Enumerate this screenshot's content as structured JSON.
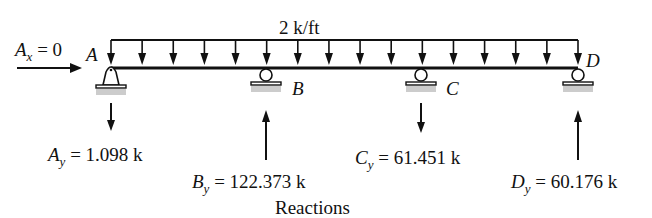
{
  "diagram": {
    "title": "Reactions",
    "load": {
      "label": "2 k/ft",
      "type": "uniform-distributed",
      "arrow_count": 16
    },
    "horizontal_reaction": {
      "symbol": "A",
      "subscript": "x",
      "value_text": "= 0"
    },
    "supports": [
      {
        "label": "A",
        "type": "pin"
      },
      {
        "label": "B",
        "type": "roller"
      },
      {
        "label": "C",
        "type": "roller"
      },
      {
        "label": "D",
        "type": "roller"
      }
    ],
    "reactions": [
      {
        "symbol": "A",
        "subscript": "y",
        "value_text": "= 1.098 k",
        "direction": "down"
      },
      {
        "symbol": "B",
        "subscript": "y",
        "value_text": "= 122.373 k",
        "direction": "up"
      },
      {
        "symbol": "C",
        "subscript": "y",
        "value_text": "= 61.451 k",
        "direction": "down"
      },
      {
        "symbol": "D",
        "subscript": "y",
        "value_text": "= 60.176 k",
        "direction": "up"
      }
    ]
  },
  "colors": {
    "ink": "#111111",
    "ground_hatch": "#bbbbbb"
  }
}
